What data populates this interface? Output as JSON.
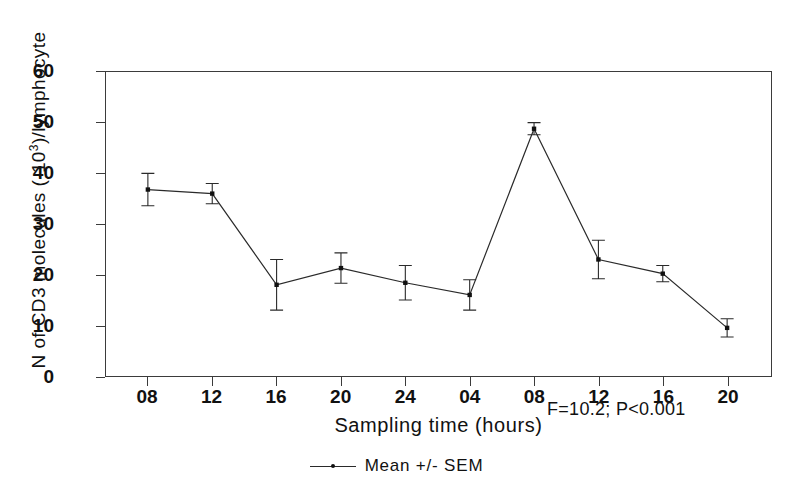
{
  "chart_data": {
    "type": "line",
    "title": "",
    "xlabel": "Sampling time (hours)",
    "ylabel": "N of CD3 molecules (·10³)/lymphocyte",
    "ylabel_prefix": "N of CD3 molecules (·10",
    "ylabel_exponent": "3",
    "ylabel_suffix": ")/lymphocyte",
    "categories": [
      "08",
      "12",
      "16",
      "20",
      "24",
      "04",
      "08",
      "12",
      "16",
      "20"
    ],
    "values": [
      36.8,
      36.0,
      18.0,
      21.3,
      18.4,
      16.0,
      48.8,
      23.0,
      20.2,
      9.5
    ],
    "errors": [
      3.2,
      2.0,
      5.0,
      3.0,
      3.4,
      3.0,
      1.2,
      3.8,
      1.6,
      1.8
    ],
    "ylim": [
      0,
      60
    ],
    "yticks": [
      0,
      10,
      20,
      30,
      40,
      50,
      60
    ],
    "ytick_labels": [
      "0",
      "10",
      "20",
      "30",
      "40",
      "50",
      "60"
    ],
    "grid": false,
    "legend_position": "below-plot",
    "legend": [
      "Mean +/- SEM"
    ],
    "annotations": [
      "F=10.2;  P<0.001"
    ],
    "series_name": "Mean +/- SEM",
    "error_type": "SEM",
    "line_color": "#2a2a2a",
    "marker_color": "#111111",
    "frame_color": "#3b3b3b",
    "background_color": "#ffffff"
  },
  "annotation": {
    "stats_text": "F=10.2;  P<0.001"
  },
  "legend": {
    "label": "Mean +/- SEM"
  }
}
